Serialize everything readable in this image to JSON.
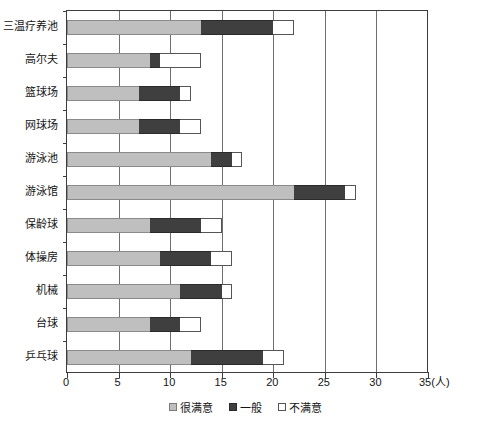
{
  "chart_data": {
    "type": "bar",
    "orientation": "horizontal",
    "stacked": true,
    "title": "",
    "xlabel": "35(人)",
    "ylabel": "",
    "xlim": [
      0,
      35
    ],
    "xticks": [
      0,
      5,
      10,
      15,
      20,
      25,
      30,
      35
    ],
    "xticklabels": [
      "0",
      "5",
      "10",
      "15",
      "20",
      "25",
      "30",
      "35"
    ],
    "xunit": "(人)",
    "grid": true,
    "legend_position": "bottom-center",
    "categories": [
      "三温疗养池",
      "高尔夫",
      "篮球场",
      "网球场",
      "游泳池",
      "游泳馆",
      "保龄球",
      "体操房",
      "机械",
      "台球",
      "乒乓球"
    ],
    "series": [
      {
        "name": "很满意",
        "color": "#bfbfbf",
        "values": [
          13,
          8,
          7,
          7,
          14,
          22,
          8,
          9,
          11,
          8,
          12
        ]
      },
      {
        "name": "一般",
        "color": "#3f3f3f",
        "values": [
          7,
          1,
          4,
          4,
          2,
          5,
          5,
          5,
          4,
          3,
          7
        ]
      },
      {
        "name": "不满意",
        "color": "#ffffff",
        "values": [
          2,
          4,
          1,
          2,
          1,
          1,
          2,
          2,
          1,
          2,
          2
        ]
      }
    ],
    "totals": [
      22,
      13,
      12,
      13,
      17,
      28,
      15,
      16,
      16,
      13,
      21
    ]
  }
}
